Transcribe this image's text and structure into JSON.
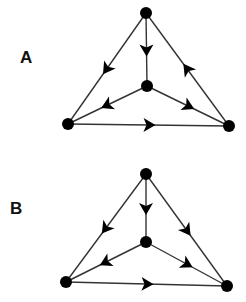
{
  "panels": [
    {
      "label": "A",
      "label_pos": [
        20,
        48
      ],
      "nodes": {
        "top": [
          146,
          13
        ],
        "center": [
          147,
          86
        ],
        "bottom_left": [
          68,
          124
        ],
        "bottom_right": [
          229,
          126
        ]
      },
      "edges": [
        {
          "from": "top",
          "to": "bottom_left",
          "arrow": "forward"
        },
        {
          "from": "top",
          "to": "center",
          "arrow": "forward"
        },
        {
          "from": "bottom_right",
          "to": "top",
          "arrow": "forward"
        },
        {
          "from": "center",
          "to": "bottom_left",
          "arrow": "forward"
        },
        {
          "from": "center",
          "to": "bottom_right",
          "arrow": "forward"
        },
        {
          "from": "bottom_left",
          "to": "bottom_right",
          "arrow": "forward"
        }
      ]
    },
    {
      "label": "B",
      "label_pos": [
        10,
        199
      ],
      "nodes": {
        "top": [
          146,
          174
        ],
        "center": [
          146,
          242
        ],
        "bottom_left": [
          66,
          282
        ],
        "bottom_right": [
          227,
          286
        ]
      },
      "edges": [
        {
          "from": "top",
          "to": "bottom_left",
          "arrow": "forward"
        },
        {
          "from": "top",
          "to": "center",
          "arrow": "forward"
        },
        {
          "from": "top",
          "to": "bottom_right",
          "arrow": "forward"
        },
        {
          "from": "center",
          "to": "bottom_left",
          "arrow": "forward"
        },
        {
          "from": "center",
          "to": "bottom_right",
          "arrow": "forward"
        },
        {
          "from": "bottom_left",
          "to": "bottom_right",
          "arrow": "forward"
        }
      ]
    }
  ],
  "style": {
    "node_color": "#000000",
    "edge_color": "#333333",
    "node_radius": 6
  }
}
